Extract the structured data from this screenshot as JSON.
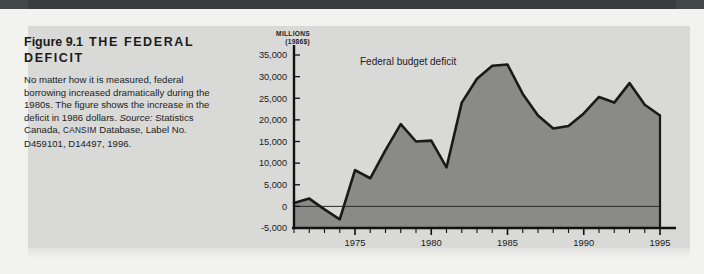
{
  "figure": {
    "number": "Figure 9.1",
    "title": "THE FEDERAL DEFICIT",
    "title_line1": "THE FEDERAL",
    "title_line2": "DEFICIT",
    "caption_text": "No matter how it is measured, federal borrowing increased dramatically during the 1980s. The figure shows the increase in the deficit in 1986 dollars. ",
    "caption_source_label": "Source:",
    "caption_source_rest": " Statistics Canada, ",
    "caption_smallcaps": "CANSIM",
    "caption_source_tail": " Database, Label No. D459101, D14497, 1996."
  },
  "colors": {
    "panel_background": "#d9d9d7",
    "page_background": "#f2f2f0",
    "header_bar": "#45464a",
    "area_fill": "#8a8a88",
    "line": "#1a1a1a",
    "axis": "#111111",
    "text": "#1b1b1b"
  },
  "chart_data": {
    "type": "area",
    "title": "",
    "series_annotation": "Federal budget deficit",
    "xlabel": "",
    "ylabel": "MILLIONS (1986$)",
    "ylabel_line1": "MILLIONS",
    "ylabel_line2": "(1986$)",
    "ylim": [
      -5000,
      35000
    ],
    "ytick_step": 5000,
    "ytick_labels": [
      "35,000",
      "30,000",
      "25,000",
      "20,000",
      "15,000",
      "10,000",
      "5,000",
      "0",
      "-5,000"
    ],
    "ytick_values": [
      35000,
      30000,
      25000,
      20000,
      15000,
      10000,
      5000,
      0,
      -5000
    ],
    "xlim": [
      1971,
      1995
    ],
    "xtick_labels": [
      "1975",
      "1980",
      "1985",
      "1990",
      "1995"
    ],
    "xtick_values": [
      1975,
      1980,
      1985,
      1990,
      1995
    ],
    "minor_xticks_every": 1,
    "grid": false,
    "legend": "inline-annotation",
    "zero_line": true,
    "x": [
      1971,
      1972,
      1973,
      1974,
      1975,
      1976,
      1977,
      1978,
      1979,
      1980,
      1981,
      1982,
      1983,
      1984,
      1985,
      1986,
      1987,
      1988,
      1989,
      1990,
      1991,
      1992,
      1993,
      1994,
      1995
    ],
    "values": [
      800,
      1800,
      -700,
      -3000,
      8400,
      6500,
      13000,
      19000,
      15000,
      15200,
      9000,
      24000,
      29500,
      32500,
      32800,
      26000,
      21000,
      18000,
      18600,
      21500,
      25300,
      24000,
      28500,
      23500,
      21000
    ]
  }
}
